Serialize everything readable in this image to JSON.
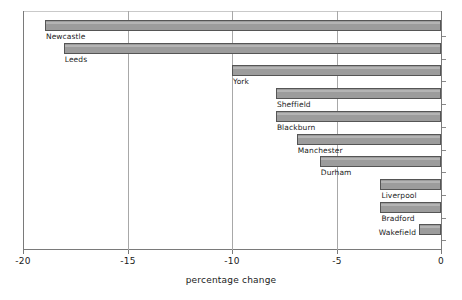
{
  "chart_data": {
    "type": "bar",
    "orientation": "horizontal",
    "title": "",
    "xlabel": "percentage change",
    "ylabel": "",
    "xlim": [
      -20,
      0
    ],
    "xticks": [
      -20,
      -15,
      -10,
      -5,
      0
    ],
    "xticklabels": [
      "-20",
      "-15",
      "-10",
      "-5",
      "0"
    ],
    "grid": true,
    "grid_axis": "x",
    "legend": null,
    "categories": [
      "Newcastle",
      "Leeds",
      "York",
      "Sheffield",
      "Blackburn",
      "Manchester",
      "Durham",
      "Liverpool",
      "Bradford",
      "Wakefield"
    ],
    "values": [
      -18.95,
      -18.05,
      -10.0,
      -7.9,
      -7.9,
      -6.9,
      -5.8,
      -2.9,
      -2.9,
      -1.05
    ],
    "bars": [
      {
        "label": "Newcastle",
        "value": -18.95
      },
      {
        "label": "Leeds",
        "value": -18.05
      },
      {
        "label": "York",
        "value": -10.0
      },
      {
        "label": "Sheffield",
        "value": -7.9
      },
      {
        "label": "Blackburn",
        "value": -7.9
      },
      {
        "label": "Manchester",
        "value": -6.9
      },
      {
        "label": "Durham",
        "value": -5.8
      },
      {
        "label": "Liverpool",
        "value": -2.9
      },
      {
        "label": "Bradford",
        "value": -2.9
      },
      {
        "label": "Wakefield",
        "value": -1.05
      }
    ],
    "colors": {
      "bar_fill": "#9c9c9c",
      "bar_edge": "#555555",
      "grid": "#a8a8a8",
      "axis": "#7a7a7a",
      "text": "#1a1a1a",
      "background": "#ffffff"
    }
  }
}
